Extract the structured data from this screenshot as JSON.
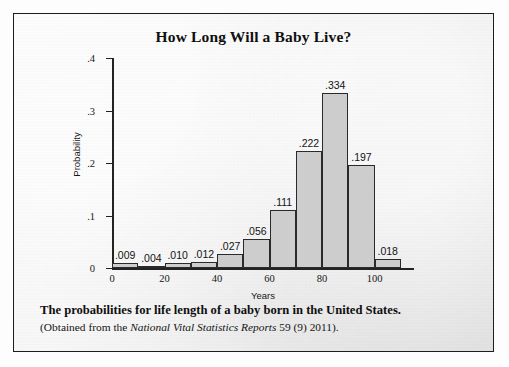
{
  "figure": {
    "title": "How Long Will a Baby Live?",
    "caption_main": "The probabilities for life length of a baby born in the United States.",
    "caption_source_prefix": "(Obtained from the ",
    "caption_source_italic": "National Vital Statistics Reports",
    "caption_source_suffix": " 59 (9) 2011).",
    "frame_color": "#1d1d1d",
    "paper_color": "#ebebeb"
  },
  "chart_data": {
    "type": "bar",
    "title": "How Long Will a Baby Live?",
    "xlabel": "Years",
    "ylabel": "Probability",
    "xlim": [
      0,
      115
    ],
    "ylim": [
      0,
      0.4
    ],
    "bin_width": 10,
    "grid": false,
    "legend": null,
    "bar_color": "#cdcdcd",
    "bar_edge_color": "#2a2a2a",
    "x_tick_labels": [
      "0",
      "20",
      "40",
      "60",
      "80",
      "100"
    ],
    "x_tick_values": [
      0,
      20,
      40,
      60,
      80,
      100
    ],
    "y_tick_labels": [
      "0",
      ".1",
      ".2",
      ".3",
      ".4"
    ],
    "y_tick_values": [
      0,
      0.1,
      0.2,
      0.3,
      0.4
    ],
    "categories": [
      "0-10",
      "10-20",
      "20-30",
      "30-40",
      "40-50",
      "50-60",
      "60-70",
      "70-80",
      "80-90",
      "90-100",
      "100-110"
    ],
    "bin_starts": [
      0,
      10,
      20,
      30,
      40,
      50,
      60,
      70,
      80,
      90,
      100
    ],
    "values": [
      0.009,
      0.004,
      0.01,
      0.012,
      0.027,
      0.056,
      0.111,
      0.222,
      0.334,
      0.197,
      0.018
    ],
    "data_labels": [
      ".009",
      ".004",
      ".010",
      ".012",
      ".027",
      ".056",
      ".111",
      ".222",
      ".334",
      ".197",
      ".018"
    ]
  }
}
